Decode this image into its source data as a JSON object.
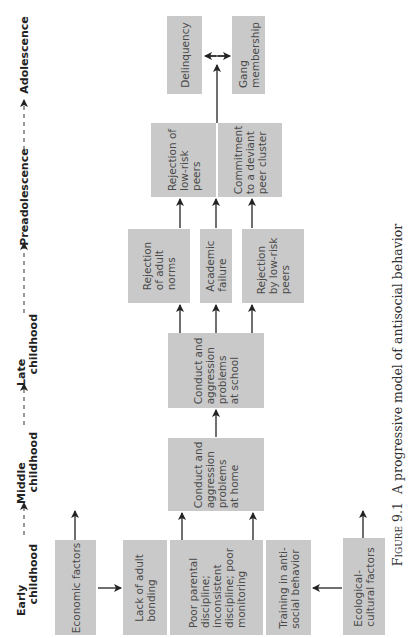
{
  "timeline": {
    "stages": [
      "Early\n   childhood",
      "Middle\n   childhood",
      "Late\n   childhood",
      "Preadolescence",
      "Adolescence"
    ]
  },
  "boxes": {
    "economic_factors": "Economic factors",
    "lack_of_adult_bonding": "Lack of adult\nbonding",
    "poor_parental_discipline": "Poor parental\ndiscipline;\ninconsistent\ndiscipline; poor\nmonitoring",
    "training_antisocial": "Training in anti-\nsocial behavior",
    "ecological_cultural": "Ecological-\ncultural factors",
    "conduct_home": "Conduct and\naggression\nproblems\nat home",
    "conduct_school": "Conduct and\naggression\nproblems\nat school",
    "rejection_adult_norms": "Rejection\nof adult\nnorms",
    "academic_failure": "Academic\nfailure",
    "rejection_by_lowrisk_peers": "Rejection\nby low-risk\npeers",
    "rejection_of_lowrisk_peers": "Rejection of\nlow-risk\npeers",
    "commitment_deviant": "Commitment\nto a deviant\npeer cluster",
    "delinquency": "Delinquency",
    "gang_membership": "Gang\nmembership"
  },
  "caption": {
    "figure_label": "Figure 9.1",
    "title": "A progressive model of antisocial behavior"
  },
  "colors": {
    "box_fill": "#c9c9c9",
    "box_text": "#4a4a4a",
    "arrow": "#222222"
  }
}
